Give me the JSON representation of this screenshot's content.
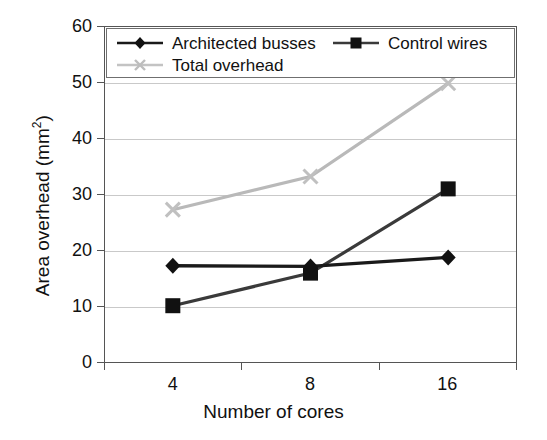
{
  "chart_data": {
    "type": "line",
    "title": "",
    "xlabel": "Number of cores",
    "ylabel": "Area overhead (mm²)",
    "categories": [
      "4",
      "8",
      "16"
    ],
    "ylim": [
      0,
      60
    ],
    "ytick_step": 10,
    "yticks": [
      "0",
      "10",
      "20",
      "30",
      "40",
      "50",
      "60"
    ],
    "grid": "horizontal",
    "legend_position": "top-inside",
    "series": [
      {
        "name": "Architected busses",
        "values": [
          17.3,
          17.2,
          18.8
        ],
        "color": "#1a1a1a",
        "marker": "diamond"
      },
      {
        "name": "Control wires",
        "values": [
          10.2,
          16.0,
          31.0
        ],
        "color": "#1a1a1a",
        "marker": "square"
      },
      {
        "name": "Total overhead",
        "values": [
          27.3,
          33.2,
          49.8
        ],
        "color": "#b9b9b9",
        "marker": "x"
      }
    ]
  },
  "axes": {
    "y_title_main": "Area overhead (mm",
    "y_title_sup": "2",
    "y_title_close": ")",
    "x_title": "Number of cores",
    "y_tick_labels": [
      "60",
      "50",
      "40",
      "30",
      "20",
      "10",
      "0"
    ],
    "x_tick_labels": [
      "4",
      "8",
      "16"
    ]
  },
  "legend": {
    "entries": [
      {
        "label": "Architected busses",
        "marker": "diamond-marker",
        "color": "#1a1a1a"
      },
      {
        "label": "Control wires",
        "marker": "square-marker",
        "color": "#1a1a1a"
      },
      {
        "label": "Total overhead",
        "marker": "x-marker",
        "color": "#b9b9b9"
      }
    ]
  }
}
